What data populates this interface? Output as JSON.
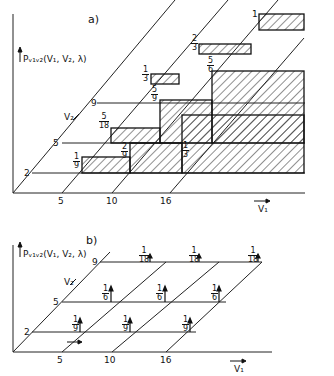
{
  "panel_a": {
    "label": "a)",
    "y_axis_title": "Pᵥ₁ᵥ₂(V₁, V₂, λ)",
    "v2_axis_label": "V₂",
    "v1_axis_label": "V₁",
    "v1_ticks": [
      "5",
      "10",
      "16"
    ],
    "v2_ticks": [
      "2",
      "5",
      "9"
    ],
    "fractions": [
      {
        "n": "1",
        "d": "9"
      },
      {
        "n": "2",
        "d": "9"
      },
      {
        "n": "1",
        "d": "3"
      },
      {
        "n": "5",
        "d": "18"
      },
      {
        "n": "5",
        "d": "9"
      },
      {
        "n": "5",
        "d": "6"
      },
      {
        "n": "1",
        "d": "3"
      },
      {
        "n": "2",
        "d": "3"
      },
      {
        "n": "1",
        "d": ""
      }
    ]
  },
  "panel_b": {
    "label": "b)",
    "y_axis_title": "Pᵥ₁ᵥ₂(V₁, V₂, λ)",
    "v2_axis_label": "V₂",
    "v1_axis_label": "V₁",
    "v1_ticks": [
      "5",
      "10",
      "16"
    ],
    "v2_ticks": [
      "2",
      "5",
      "9"
    ],
    "fractions": [
      {
        "n": "1",
        "d": "9"
      },
      {
        "n": "1",
        "d": "9"
      },
      {
        "n": "1",
        "d": "9"
      },
      {
        "n": "1",
        "d": "6"
      },
      {
        "n": "1",
        "d": "6"
      },
      {
        "n": "1",
        "d": "6"
      },
      {
        "n": "1",
        "d": "18"
      },
      {
        "n": "1",
        "d": "18"
      },
      {
        "n": "1",
        "d": "18"
      }
    ]
  }
}
